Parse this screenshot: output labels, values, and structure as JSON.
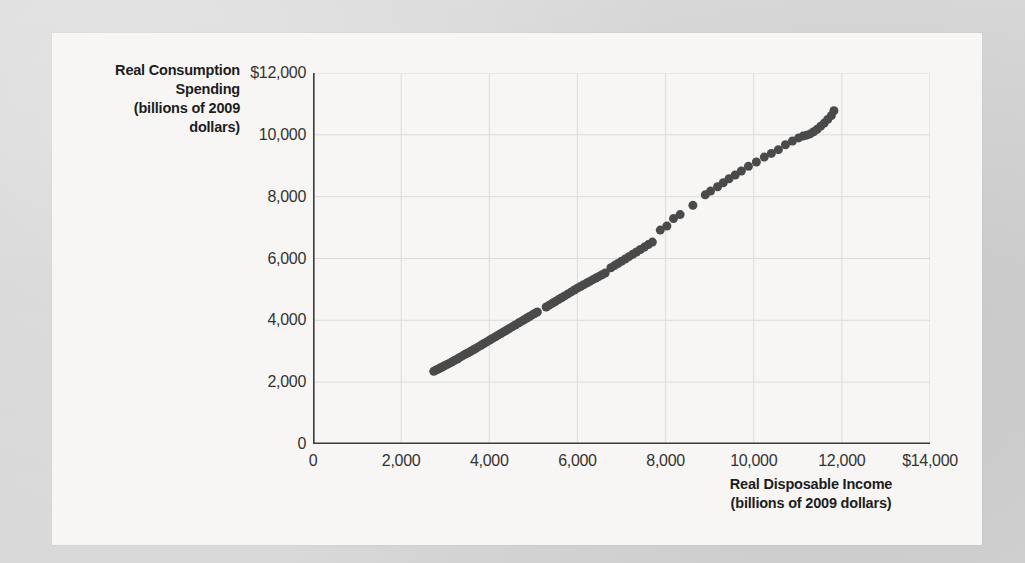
{
  "figure": {
    "background_color": "#f7f6f4",
    "page_color": "#d6d6d6"
  },
  "chart_data": {
    "type": "scatter",
    "title": "",
    "xlabel": "Real Disposable Income\n(billions of 2009 dollars)",
    "ylabel": "Real Consumption Spending\n(billions of 2009 dollars)",
    "xlabel_line1": "Real Disposable Income",
    "xlabel_line2": "(billions of 2009 dollars)",
    "ylabel_line1": "Real Consumption",
    "ylabel_line2": "Spending",
    "ylabel_line3": "(billions of 2009",
    "ylabel_line4": "dollars)",
    "xlim": [
      0,
      14000
    ],
    "ylim": [
      0,
      12000
    ],
    "xticks": [
      0,
      2000,
      4000,
      6000,
      8000,
      10000,
      12000,
      14000
    ],
    "xtick_labels": [
      "0",
      "2,000",
      "4,000",
      "6,000",
      "8,000",
      "10,000",
      "12,000",
      "$14,000"
    ],
    "yticks": [
      0,
      2000,
      4000,
      6000,
      8000,
      10000,
      12000
    ],
    "ytick_labels": [
      "0",
      "2,000",
      "4,000",
      "6,000",
      "8,000",
      "10,000",
      "$12,000"
    ],
    "grid": true,
    "grid_color": "#dcdcdc",
    "axis_color": "#3a3a3a",
    "legend": null,
    "marker": {
      "shape": "circle",
      "color": "#4a4a4a",
      "size_px": 9,
      "opacity": 1
    },
    "series": [
      {
        "name": "Real consumption spending vs real disposable income",
        "points": [
          [
            2740,
            2350
          ],
          [
            2790,
            2390
          ],
          [
            2840,
            2420
          ],
          [
            2880,
            2455
          ],
          [
            2930,
            2490
          ],
          [
            2985,
            2530
          ],
          [
            3040,
            2570
          ],
          [
            3100,
            2615
          ],
          [
            3160,
            2660
          ],
          [
            3215,
            2705
          ],
          [
            3275,
            2750
          ],
          [
            3330,
            2800
          ],
          [
            3390,
            2850
          ],
          [
            3450,
            2900
          ],
          [
            3510,
            2945
          ],
          [
            3570,
            2990
          ],
          [
            3630,
            3040
          ],
          [
            3690,
            3090
          ],
          [
            3750,
            3140
          ],
          [
            3815,
            3195
          ],
          [
            3880,
            3250
          ],
          [
            3945,
            3305
          ],
          [
            4010,
            3360
          ],
          [
            4075,
            3415
          ],
          [
            4140,
            3470
          ],
          [
            4200,
            3520
          ],
          [
            4265,
            3575
          ],
          [
            4330,
            3630
          ],
          [
            4390,
            3680
          ],
          [
            4455,
            3735
          ],
          [
            4520,
            3790
          ],
          [
            4590,
            3850
          ],
          [
            4660,
            3910
          ],
          [
            4725,
            3965
          ],
          [
            4790,
            4020
          ],
          [
            4855,
            4075
          ],
          [
            4915,
            4125
          ],
          [
            4975,
            4175
          ],
          [
            5030,
            4220
          ],
          [
            5090,
            4270
          ],
          [
            5290,
            4430
          ],
          [
            5360,
            4490
          ],
          [
            5430,
            4550
          ],
          [
            5500,
            4610
          ],
          [
            5570,
            4670
          ],
          [
            5640,
            4730
          ],
          [
            5710,
            4790
          ],
          [
            5785,
            4855
          ],
          [
            5860,
            4920
          ],
          [
            5930,
            4980
          ],
          [
            6000,
            5040
          ],
          [
            6070,
            5095
          ],
          [
            6140,
            5150
          ],
          [
            6210,
            5205
          ],
          [
            6280,
            5260
          ],
          [
            6350,
            5315
          ],
          [
            6420,
            5370
          ],
          [
            6490,
            5420
          ],
          [
            6560,
            5475
          ],
          [
            6630,
            5530
          ],
          [
            6760,
            5700
          ],
          [
            6840,
            5770
          ],
          [
            6920,
            5840
          ],
          [
            7000,
            5910
          ],
          [
            7085,
            5985
          ],
          [
            7170,
            6060
          ],
          [
            7255,
            6135
          ],
          [
            7340,
            6210
          ],
          [
            7430,
            6290
          ],
          [
            7520,
            6370
          ],
          [
            7610,
            6450
          ],
          [
            7700,
            6530
          ],
          [
            7880,
            6920
          ],
          [
            8030,
            7050
          ],
          [
            8180,
            7290
          ],
          [
            8330,
            7420
          ],
          [
            8620,
            7720
          ],
          [
            8900,
            8060
          ],
          [
            9020,
            8180
          ],
          [
            9180,
            8320
          ],
          [
            9310,
            8450
          ],
          [
            9440,
            8580
          ],
          [
            9580,
            8700
          ],
          [
            9720,
            8830
          ],
          [
            9880,
            8980
          ],
          [
            10060,
            9120
          ],
          [
            10240,
            9280
          ],
          [
            10400,
            9400
          ],
          [
            10560,
            9520
          ],
          [
            10720,
            9680
          ],
          [
            10880,
            9800
          ],
          [
            11020,
            9900
          ],
          [
            11120,
            9960
          ],
          [
            11200,
            9990
          ],
          [
            11280,
            10030
          ],
          [
            11360,
            10100
          ],
          [
            11440,
            10180
          ],
          [
            11520,
            10280
          ],
          [
            11600,
            10380
          ],
          [
            11680,
            10500
          ],
          [
            11760,
            10620
          ],
          [
            11820,
            10780
          ]
        ]
      }
    ]
  }
}
